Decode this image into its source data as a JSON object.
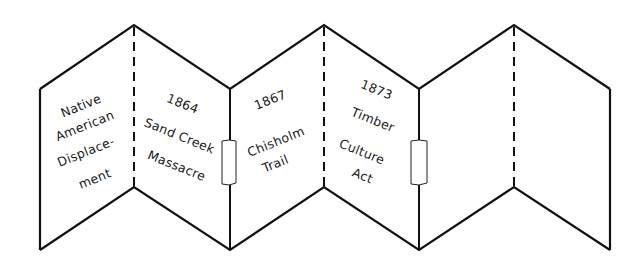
{
  "diagram": {
    "colors": {
      "stroke": "#111111",
      "background": "#ffffff",
      "text": "#1a1a1a"
    },
    "folds": [
      {
        "left_panel": {
          "lines": [
            "Native",
            "American",
            "Displace-",
            "ment"
          ]
        },
        "right_panel": {
          "lines": [
            "1864",
            "Sand Creek",
            "Massacre"
          ]
        }
      },
      {
        "left_panel": {
          "lines": [
            "1867",
            "Chisholm",
            "Trail"
          ]
        },
        "right_panel": {
          "lines": [
            "1873",
            "Timber",
            "Culture",
            "Act"
          ]
        }
      },
      {
        "left_panel": {
          "lines": []
        },
        "right_panel": {
          "lines": []
        }
      }
    ],
    "tabs": [
      {
        "name": "tab-connector-1"
      },
      {
        "name": "tab-connector-2"
      }
    ]
  }
}
